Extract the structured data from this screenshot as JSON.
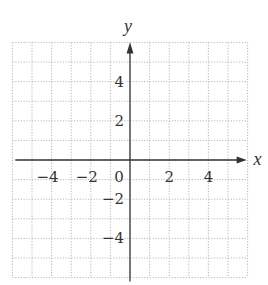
{
  "chart_data": {
    "type": "coordinate-grid",
    "title": "",
    "xlabel": "x",
    "ylabel": "y",
    "xlim": [
      -6,
      6
    ],
    "ylim": [
      -6,
      6
    ],
    "grid": true,
    "grid_step": 1,
    "grid_style": "dotted",
    "x_tick_labels": [
      "-4",
      "-2",
      "0",
      "2",
      "4"
    ],
    "x_tick_values": [
      -4,
      -2,
      0,
      2,
      4
    ],
    "y_tick_labels": [
      "4",
      "2",
      "-2",
      "-4"
    ],
    "y_tick_values": [
      4,
      2,
      -2,
      -4
    ],
    "axis_arrows": [
      "positive-x",
      "positive-y"
    ],
    "series": []
  },
  "colors": {
    "axis": "#333333",
    "grid": "#b8b8b8",
    "background": "#ffffff"
  }
}
